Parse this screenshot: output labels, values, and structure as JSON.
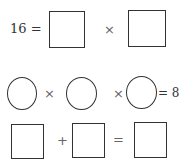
{
  "row1": {
    "lhs": "16 =",
    "op": "×"
  },
  "row2": {
    "op1": "×",
    "op2": "×",
    "rhs": "= 8"
  },
  "row3": {
    "op1": "+",
    "op2": "="
  }
}
